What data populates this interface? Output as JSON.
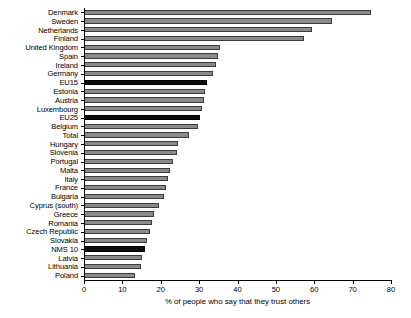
{
  "chart_data": {
    "type": "bar",
    "orientation": "horizontal",
    "title": "",
    "xlabel": "% of people who say that they trust others",
    "ylabel": "",
    "xlim": [
      0,
      80
    ],
    "xticks": [
      0,
      10,
      20,
      30,
      40,
      50,
      60,
      70,
      80
    ],
    "grid": false,
    "legend": null,
    "categories": [
      "Denmark",
      "Sweden",
      "Netherlands",
      "Finland",
      "United Kingdom",
      "Spain",
      "Ireland",
      "Germany",
      "EU15",
      "Estonia",
      "Austria",
      "Luxembourg",
      "EU25",
      "Belgium",
      "Total",
      "Hungary",
      "Slovenia",
      "Portugal",
      "Malta",
      "Italy",
      "France",
      "Bulgaria",
      "Cyprus (south)",
      "Greece",
      "Romania",
      "Czech Republic",
      "Slovakia",
      "NMS 10",
      "Latvia",
      "Lithuania",
      "Poland"
    ],
    "values": [
      74.7,
      64.6,
      59.4,
      57.3,
      35.4,
      34.9,
      34.3,
      33.5,
      32.0,
      31.6,
      31.2,
      30.8,
      30.2,
      29.8,
      27.3,
      24.6,
      24.2,
      23.1,
      22.3,
      21.8,
      21.4,
      20.8,
      19.6,
      18.2,
      17.6,
      17.2,
      16.5,
      15.9,
      15.1,
      14.8,
      13.2
    ],
    "highlighted": [
      "EU15",
      "EU25",
      "NMS 10"
    ],
    "colors": {
      "bar": "#8a8a8a",
      "bar_edge": "#3b3b3b",
      "bar_highlight": "#0d0d0d",
      "axis": "#000000",
      "background": "#ffffff"
    }
  }
}
